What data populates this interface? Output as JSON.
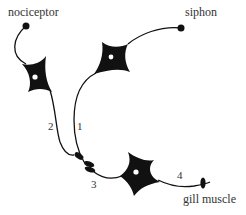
{
  "diagram": {
    "labels": {
      "nociceptor": "nociceptor",
      "siphon": "siphon",
      "gill_muscle": "gill muscle",
      "n1": "1",
      "n2": "2",
      "n3": "3",
      "n4": "4"
    },
    "colors": {
      "ink": "#111111",
      "text": "#333333",
      "background": "#ffffff"
    }
  }
}
